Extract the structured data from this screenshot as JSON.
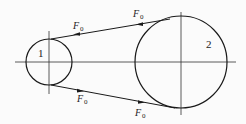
{
  "diagram": {
    "type": "belt-drive",
    "pulleys": [
      {
        "id": "pulley-1",
        "label": "1",
        "cx": 49,
        "cy": 62,
        "r": 23
      },
      {
        "id": "pulley-2",
        "label": "2",
        "cx": 181,
        "cy": 62,
        "r": 46
      }
    ],
    "forces": [
      {
        "position": "top-left",
        "symbol": "F",
        "subscript": "0"
      },
      {
        "position": "top-right",
        "symbol": "F",
        "subscript": "0"
      },
      {
        "position": "bottom-left",
        "symbol": "F",
        "subscript": "0"
      },
      {
        "position": "bottom-right",
        "symbol": "F",
        "subscript": "0"
      }
    ],
    "colors": {
      "line": "#1a1a1a",
      "background": "#fbfbfb"
    }
  }
}
